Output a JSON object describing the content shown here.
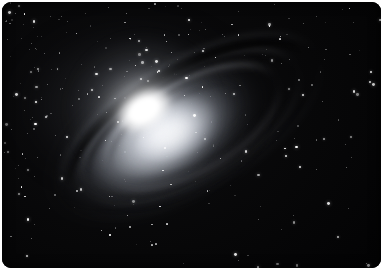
{
  "image": {
    "kind": "astronomical-photograph",
    "subject": "spiral galaxy",
    "color_mode": "grayscale",
    "alt_text": "Grayscale astronomical photograph of an inclined spiral galaxy with a brilliant white nucleus, sweeping dust lanes, and a dense surrounding star field on a black sky.",
    "width": 391,
    "height": 275
  },
  "frame": {
    "border_radius": 9,
    "margin_left": 2,
    "margin_top": 2,
    "margin_right": 10,
    "margin_bottom": 7,
    "page_background": "#ffffff",
    "plate_background": "#000000"
  },
  "palette": {
    "sky_black": "#000000",
    "deep_space": "#070708",
    "nucleus_white": "#ffffff",
    "disk_highlight": "#e8ebf0",
    "disk_midtone": "#9aa0aa",
    "dust_lane_dark": "#060608",
    "star_white": "#ffffff"
  },
  "galaxy": {
    "center_x": 145,
    "center_y": 115,
    "inclination_angle_deg": -30,
    "major_axis_px": 300,
    "minor_axis_px": 130,
    "nucleus": {
      "x": 142,
      "y": 108,
      "width": 62,
      "height": 40
    },
    "features": [
      "bright saturated nucleus",
      "inclined luminous disk",
      "dark dust lane along upper limb",
      "multiple spiral dust lanes",
      "extended faint outer halo"
    ]
  },
  "starfield": {
    "bright_star_count": 120,
    "faint_star_count": 180,
    "densest_region": "upper-left",
    "sparsest_region": "right"
  }
}
